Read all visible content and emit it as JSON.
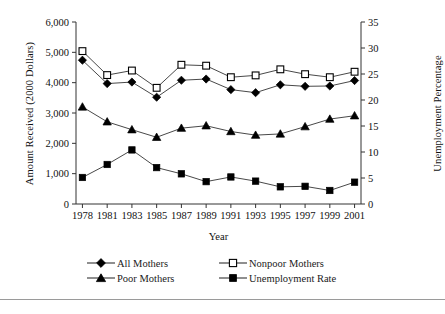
{
  "chart_data": {
    "type": "line",
    "title": "",
    "xlabel": "Year",
    "ylabel": "Amount Received (2000 Dollars)",
    "ylabel_right": "Unemployment Percentage",
    "categories": [
      "1978",
      "1981",
      "1983",
      "1985",
      "1987",
      "1989",
      "1991",
      "1993",
      "1995",
      "1997",
      "1999",
      "2001"
    ],
    "ylim": [
      0,
      6000
    ],
    "yticks": [
      "0",
      "1,000",
      "2,000",
      "3,000",
      "4,000",
      "5,000",
      "6,000"
    ],
    "ylim_right": [
      0,
      35
    ],
    "yticks_right": [
      "0",
      "5",
      "10",
      "15",
      "20",
      "25",
      "30",
      "35"
    ],
    "grid": false,
    "legend_position": "bottom",
    "series": [
      {
        "name": "All Mothers",
        "axis": "left",
        "marker": "filled-diamond",
        "values": [
          4740,
          3970,
          4020,
          3520,
          4080,
          4120,
          3770,
          3670,
          3930,
          3880,
          3890,
          4070
        ]
      },
      {
        "name": "Nonpoor Mothers",
        "axis": "left",
        "marker": "open-square",
        "values": [
          5040,
          4250,
          4400,
          3830,
          4590,
          4560,
          4180,
          4240,
          4440,
          4280,
          4180,
          4360
        ]
      },
      {
        "name": "Poor Mothers",
        "axis": "left",
        "marker": "filled-triangle",
        "values": [
          3200,
          2710,
          2450,
          2200,
          2500,
          2580,
          2390,
          2270,
          2310,
          2550,
          2800,
          2910
        ]
      },
      {
        "name": "Unemployment Rate",
        "axis": "right",
        "marker": "filled-square",
        "values": [
          5.1,
          7.6,
          10.4,
          7.0,
          5.8,
          4.3,
          5.2,
          4.4,
          3.3,
          3.4,
          2.6,
          4.2
        ]
      }
    ]
  },
  "legend": {
    "items": [
      {
        "label": "All Mothers",
        "marker": "filled-diamond"
      },
      {
        "label": "Nonpoor Mothers",
        "marker": "open-square"
      },
      {
        "label": "Poor Mothers",
        "marker": "filled-triangle"
      },
      {
        "label": "Unemployment Rate",
        "marker": "filled-square"
      }
    ]
  },
  "colors": {
    "line": "#333333",
    "marker": "#000000",
    "axis": "#333333",
    "text": "#111111",
    "rule": "#9a9a9a"
  }
}
